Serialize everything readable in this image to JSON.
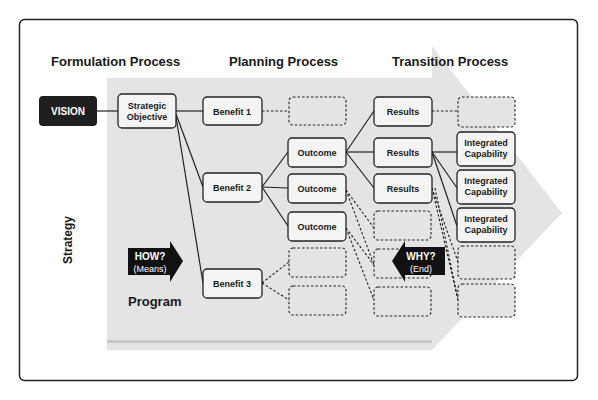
{
  "headers": {
    "formulation": "Formulation Process",
    "planning": "Planning Process",
    "transition": "Transition Process"
  },
  "side_labels": {
    "strategy": "Strategy",
    "program": "Program"
  },
  "nodes": {
    "vision": "VISION",
    "strategic_objective_line1": "Strategic",
    "strategic_objective_line2": "Objective",
    "benefit1": "Benefit 1",
    "benefit2": "Benefit 2",
    "benefit3": "Benefit 3",
    "outcome1": "Outcome",
    "outcome2": "Outcome",
    "outcome3": "Outcome",
    "results1": "Results",
    "results2": "Results",
    "results3": "Results",
    "cap1_line1": "Integrated",
    "cap1_line2": "Capability",
    "cap2_line1": "Integrated",
    "cap2_line2": "Capability",
    "cap3_line1": "Integrated",
    "cap3_line2": "Capability"
  },
  "arrows": {
    "how_title": "HOW?",
    "how_sub": "(Means)",
    "why_title": "WHY?",
    "why_sub": "(End)"
  },
  "colors": {
    "background_band": "#e3e3e3",
    "vision_fill": "#1f1f1f",
    "node_fill": "#f4f4f4",
    "stroke": "#222222"
  }
}
